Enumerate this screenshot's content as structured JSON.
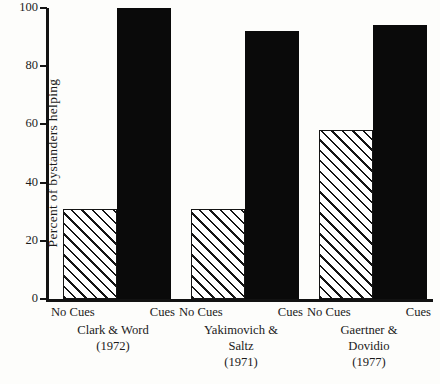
{
  "chart_data": {
    "type": "bar",
    "title": "",
    "xlabel": "",
    "ylabel": "Percent of bystanders helping",
    "ylim": [
      0,
      100
    ],
    "yticks": [
      0,
      20,
      40,
      60,
      80,
      100
    ],
    "ytick_labels": [
      "0",
      "20",
      "40",
      "60",
      "80",
      "100"
    ],
    "grid": false,
    "legend": "none",
    "categories": [
      "Clark & Word (1972)",
      "Yakimovich & Saltz (1971)",
      "Gaertner & Dovidio (1977)"
    ],
    "series": [
      {
        "name": "No Cues",
        "values": [
          31,
          31,
          58
        ]
      },
      {
        "name": "Cues",
        "values": [
          100,
          92,
          94
        ]
      }
    ],
    "groups": [
      {
        "study_line1": "Clark & Word",
        "study_line2": "",
        "year": "(1972)",
        "bars": [
          {
            "condition": "No Cues",
            "value": 31,
            "fill": "hatch"
          },
          {
            "condition": "Cues",
            "value": 100,
            "fill": "solid"
          }
        ]
      },
      {
        "study_line1": "Yakimovich &",
        "study_line2": "Saltz",
        "year": "(1971)",
        "bars": [
          {
            "condition": "No Cues",
            "value": 31,
            "fill": "hatch"
          },
          {
            "condition": "Cues",
            "value": 92,
            "fill": "solid"
          }
        ]
      },
      {
        "study_line1": "Gaertner &",
        "study_line2": "Dovidio",
        "year": "(1977)",
        "bars": [
          {
            "condition": "No Cues",
            "value": 58,
            "fill": "hatch"
          },
          {
            "condition": "Cues",
            "value": 94,
            "fill": "solid"
          }
        ]
      }
    ],
    "colors": {
      "solid_bar": "#0a0a0a",
      "hatch_line": "#141414",
      "hatch_background": "#ffffff",
      "axis": "#121212",
      "text": "#1c1c1c",
      "page_background": "#fdfdfb"
    }
  },
  "axis": {
    "y_title": "Percent of bystanders helping"
  }
}
